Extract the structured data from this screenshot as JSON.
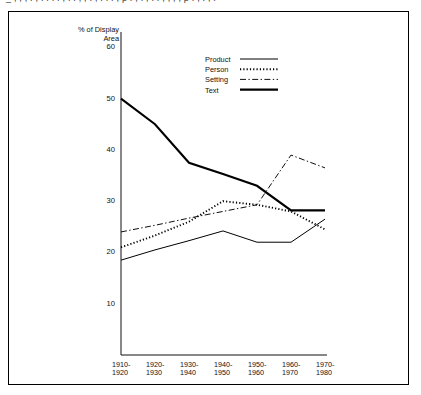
{
  "page": {
    "cutoff_header_text": "_ , , ,  . ,  .  .  .  .  ,  .  .  ,  ,  .  ,  .  .  .  , p . ,  .  ,  .  .  ,  ,  ,  , p . ,  .  ,  ."
  },
  "chart_data": {
    "type": "line",
    "title": "",
    "ylabel": "% of Display\nArea",
    "xlabel": "",
    "ylim": [
      0,
      63
    ],
    "yticks": [
      10,
      20,
      30,
      40,
      50,
      60
    ],
    "ytick_labels": [
      "10",
      "20",
      "30",
      "40",
      "50",
      "60"
    ],
    "grid": false,
    "legend_position": "top-center",
    "categories": [
      "1910-\n1920",
      "1920-\n1930",
      "1930-\n1940",
      "1940-\n1950",
      "1950-\n1960",
      "1960-\n1970",
      "1970-\n1980"
    ],
    "category_labels_flat": [
      "1910-1920",
      "1920-1930",
      "1930-1940",
      "1940-1950",
      "1950-1960",
      "1960-1970",
      "1970-1980"
    ],
    "series": [
      {
        "name": "Product",
        "style": "solid-thin",
        "color": "#000000",
        "values": [
          18.5,
          20.5,
          22.3,
          24.2,
          22.0,
          22.0,
          26.5
        ]
      },
      {
        "name": "Person",
        "style": "dotted",
        "color": "#000000",
        "values": [
          21.0,
          23.3,
          26.0,
          30.0,
          29.3,
          28.0,
          24.5
        ]
      },
      {
        "name": "Setting",
        "style": "dash-dot",
        "color": "#000000",
        "values": [
          24.0,
          25.3,
          26.7,
          28.0,
          29.3,
          39.0,
          36.5
        ]
      },
      {
        "name": "Text",
        "style": "solid-thick",
        "color": "#000000",
        "values": [
          50.0,
          45.0,
          37.5,
          35.3,
          33.0,
          28.2,
          28.2
        ]
      }
    ]
  },
  "legend": {
    "items": [
      {
        "label": "Product",
        "swatch": "solid-thin"
      },
      {
        "label": "Person",
        "swatch": "dotted"
      },
      {
        "label": "Setting",
        "swatch": "dash-dot"
      },
      {
        "label": "Text",
        "swatch": "solid-thick"
      }
    ]
  }
}
